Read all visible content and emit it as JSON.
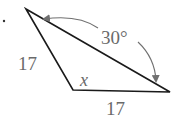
{
  "diagram": {
    "type": "triangle",
    "labels": {
      "left_side": "17",
      "bottom_side": "17",
      "angle_x": "x",
      "angle_given": "30°"
    },
    "colors": {
      "line": "#1a1a1a",
      "label": "#6a6a6a",
      "arrow": "#707070"
    }
  }
}
